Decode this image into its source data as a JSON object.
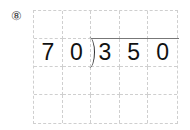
{
  "problem_number": "⑧",
  "division": {
    "divisor": [
      "7",
      "0"
    ],
    "dividend": [
      "3",
      "5",
      "0"
    ]
  },
  "grid": {
    "columns": 5,
    "rows": 4
  }
}
